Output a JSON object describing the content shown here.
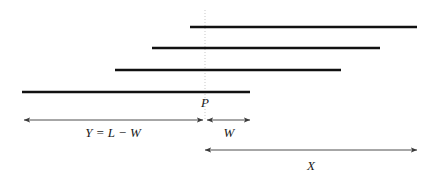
{
  "figure": {
    "canvas": {
      "width": 436,
      "height": 178,
      "background": "#ffffff"
    },
    "colors": {
      "bar": "#111111",
      "dimension_line": "#3a3a3a",
      "marker_line": "#b9b9b9",
      "label_text": "#1a1a1a"
    },
    "bars": [
      {
        "name": "interval-bar-1",
        "x1": 190,
        "x2": 417,
        "y": 27
      },
      {
        "name": "interval-bar-2",
        "x1": 152,
        "x2": 380,
        "y": 48
      },
      {
        "name": "interval-bar-3",
        "x1": 115,
        "x2": 341,
        "y": 70
      },
      {
        "name": "interval-bar-4",
        "x1": 22,
        "x2": 250,
        "y": 92
      }
    ],
    "marker": {
      "label": "P",
      "x": 205,
      "line_top": 10,
      "line_bottom": 120,
      "label_x": 205,
      "label_y": 107
    },
    "dimensions": [
      {
        "name": "dimension-y",
        "label": "Y = L − W",
        "x1": 24,
        "x2": 203,
        "y": 120,
        "label_x": 113,
        "label_y": 137
      },
      {
        "name": "dimension-w",
        "label": "W",
        "x1": 207,
        "x2": 250,
        "y": 120,
        "label_x": 229,
        "label_y": 137
      },
      {
        "name": "dimension-x",
        "label": "X",
        "x1": 205,
        "x2": 417,
        "y": 150,
        "label_x": 311,
        "label_y": 170
      }
    ]
  }
}
